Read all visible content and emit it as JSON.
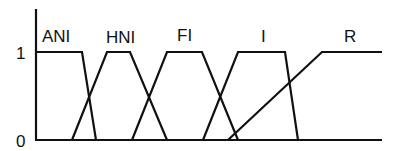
{
  "diagram": {
    "type": "fuzzy-membership-functions",
    "y_axis": {
      "ticks": [
        "0",
        "1"
      ]
    },
    "sets": [
      {
        "label": "ANI",
        "points": [
          [
            36,
            52
          ],
          [
            82,
            52
          ],
          [
            96,
            140
          ]
        ]
      },
      {
        "label": "HNI",
        "points": [
          [
            72,
            140
          ],
          [
            107,
            52
          ],
          [
            130,
            52
          ],
          [
            167,
            140
          ]
        ]
      },
      {
        "label": "FI",
        "points": [
          [
            132,
            140
          ],
          [
            167,
            52
          ],
          [
            202,
            52
          ],
          [
            238,
            140
          ]
        ]
      },
      {
        "label": "I",
        "points": [
          [
            203,
            140
          ],
          [
            238,
            52
          ],
          [
            285,
            52
          ],
          [
            298,
            140
          ]
        ]
      },
      {
        "label": "R",
        "points": [
          [
            228,
            140
          ],
          [
            322,
            52
          ],
          [
            382,
            52
          ]
        ]
      }
    ],
    "colors": {
      "stroke": "#111111",
      "background": "#ffffff"
    }
  },
  "labels": {
    "ani": "ANI",
    "hni": "HNI",
    "fi": "FI",
    "i": "I",
    "r": "R",
    "tick_one": "1",
    "tick_zero": "0"
  }
}
